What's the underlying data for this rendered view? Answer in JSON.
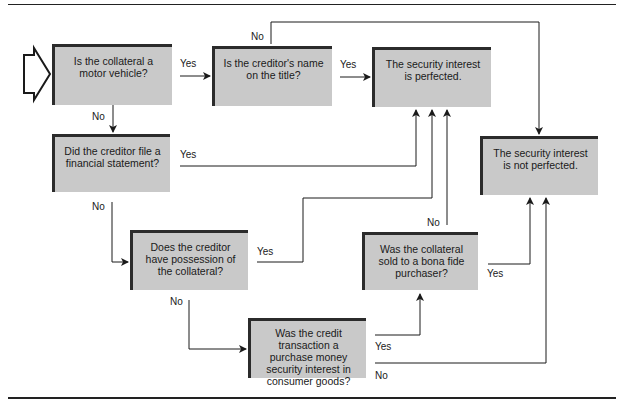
{
  "diagram": {
    "type": "flowchart",
    "nodes": {
      "motor_vehicle": "Is the collateral a motor vehicle?",
      "name_on_title": "Is the creditor's name on the title?",
      "perfected": "The security interest is perfected.",
      "financial_statement": "Did the creditor file a financial statement?",
      "possession": "Does the creditor have possession of the collateral?",
      "not_perfected": "The security interest is not perfected.",
      "bona_fide": "Was the collateral sold to a bona fide purchaser?",
      "pmsi": "Was the credit transaction a purchase money security interest in consumer goods?"
    },
    "labels": {
      "yes": "Yes",
      "no": "No"
    },
    "edges": [
      {
        "from": "motor_vehicle",
        "to": "name_on_title",
        "label": "Yes"
      },
      {
        "from": "motor_vehicle",
        "to": "financial_statement",
        "label": "No"
      },
      {
        "from": "name_on_title",
        "to": "perfected",
        "label": "Yes"
      },
      {
        "from": "name_on_title",
        "to": "not_perfected",
        "label": "No"
      },
      {
        "from": "financial_statement",
        "to": "perfected",
        "label": "Yes"
      },
      {
        "from": "financial_statement",
        "to": "possession",
        "label": "No"
      },
      {
        "from": "possession",
        "to": "perfected",
        "label": "Yes"
      },
      {
        "from": "possession",
        "to": "pmsi",
        "label": "No"
      },
      {
        "from": "pmsi",
        "to": "bona_fide",
        "label": "Yes"
      },
      {
        "from": "pmsi",
        "to": "not_perfected",
        "label": "No"
      },
      {
        "from": "bona_fide",
        "to": "not_perfected",
        "label": "Yes"
      },
      {
        "from": "bona_fide",
        "to": "perfected",
        "label": "No"
      }
    ]
  }
}
